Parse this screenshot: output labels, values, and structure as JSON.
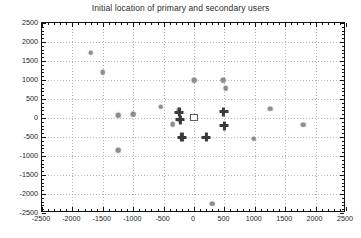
{
  "figure": {
    "title": "Initial location of primary and secondary users",
    "background_color": "#ffffff",
    "axis_color": "#111111",
    "grid_color": "#b9b9b9"
  },
  "chart_data": {
    "type": "scatter",
    "title": "Initial location of primary and secondary users",
    "xlabel": "",
    "ylabel": "",
    "xlim": [
      -2500,
      2500
    ],
    "ylim": [
      -2500,
      2500
    ],
    "xticks": [
      -2500,
      -2000,
      -1500,
      -1000,
      -500,
      0,
      500,
      1000,
      1500,
      2000,
      2500
    ],
    "yticks": [
      -2500,
      -2000,
      -1500,
      -1000,
      -500,
      0,
      500,
      1000,
      1500,
      2000,
      2500
    ],
    "xtick_labels": [
      "-2500",
      "-2000",
      "-1500",
      "-1000",
      "-500",
      "0",
      "500",
      "1000",
      "1500",
      "2000",
      "2500"
    ],
    "ytick_labels": [
      "-2500",
      "-2000",
      "-1500",
      "-1000",
      "-500",
      "0",
      "500",
      "1000",
      "1500",
      "2000",
      "2500"
    ],
    "grid": true,
    "grid_style": "dotted",
    "legend": null,
    "series": [
      {
        "name": "secondary users",
        "marker": "dot",
        "color": "#8c8c8c",
        "points": [
          [
            -1700,
            1720
          ],
          [
            -1500,
            1210
          ],
          [
            -1250,
            70
          ],
          [
            -1250,
            -850
          ],
          [
            -1000,
            100
          ],
          [
            -550,
            300
          ],
          [
            -350,
            -160
          ],
          [
            -250,
            200
          ],
          [
            -250,
            -40
          ],
          [
            0,
            1000
          ],
          [
            300,
            -2250
          ],
          [
            480,
            1000
          ],
          [
            520,
            780
          ],
          [
            980,
            -540
          ],
          [
            1250,
            250
          ],
          [
            1800,
            -180
          ]
        ]
      },
      {
        "name": "primary users",
        "marker": "plus",
        "color": "#3a3a3a",
        "points": [
          [
            -240,
            150
          ],
          [
            -230,
            -40
          ],
          [
            -200,
            -510
          ],
          [
            200,
            -500
          ],
          [
            490,
            170
          ],
          [
            500,
            -200
          ]
        ]
      },
      {
        "name": "central spike",
        "marker": "cone",
        "color": "#1a1a1a",
        "points": [
          [
            0,
            500
          ]
        ]
      }
    ]
  }
}
